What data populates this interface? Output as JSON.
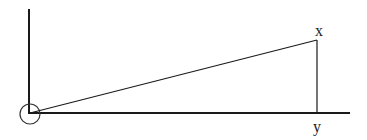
{
  "diagram": {
    "type": "right-triangle-on-axes",
    "labels": {
      "apex": "x",
      "foot": "y"
    },
    "colors": {
      "stroke": "#1a1a1a",
      "background": "#ffffff"
    },
    "elements": {
      "vertical_axis": {
        "x": 29,
        "y1": 9,
        "y2": 114
      },
      "horizontal_axis": {
        "y": 113,
        "x1": 29,
        "x2": 350
      },
      "origin_circle": {
        "cx": 30,
        "cy": 114,
        "r": 10
      },
      "hypotenuse": {
        "x1": 30,
        "y1": 113,
        "x2": 317,
        "y2": 40
      },
      "vertical_side": {
        "x": 317,
        "y1": 40,
        "y2": 113
      }
    }
  }
}
